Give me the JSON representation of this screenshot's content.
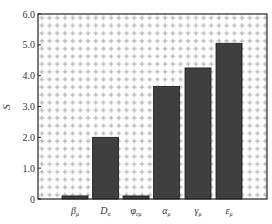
{
  "chart_data": {
    "type": "bar",
    "title": "",
    "xlabel": "",
    "ylabel": "S",
    "ylim": [
      0,
      6.0
    ],
    "yticks": [
      0,
      1.0,
      2.0,
      3.0,
      4.0,
      5.0,
      6.0
    ],
    "ytick_labels": [
      "0",
      "1.0",
      "2.0",
      "3.0",
      "4.0",
      "5.0",
      "6.0"
    ],
    "categories": [
      "β_μ",
      "D_α",
      "φ_cμ",
      "α_μ",
      "γ_μ",
      "ε_μ"
    ],
    "category_display": [
      {
        "base": "β",
        "sub": "μ"
      },
      {
        "base": "D",
        "sub": "α"
      },
      {
        "base": "φ",
        "sub": "cμ"
      },
      {
        "base": "α",
        "sub": "μ"
      },
      {
        "base": "γ",
        "sub": "μ"
      },
      {
        "base": "ε",
        "sub": "μ"
      }
    ],
    "values": [
      0.1,
      2.0,
      0.1,
      3.65,
      4.25,
      5.05
    ],
    "bar_color": "#3f3f3f",
    "background_pattern": "grid of small plus/cross marks",
    "grid": true,
    "legend": null
  }
}
